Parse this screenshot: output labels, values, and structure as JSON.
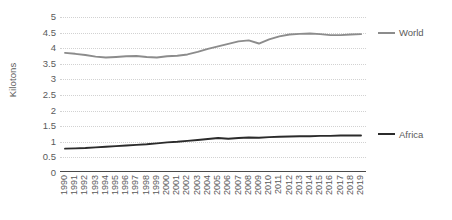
{
  "chart_data": {
    "type": "line",
    "title": "",
    "xlabel": "",
    "ylabel": "Kilotons",
    "ylim": [
      0,
      5
    ],
    "yticks": [
      "0",
      "0.5",
      "1",
      "1.5",
      "2",
      "2.5",
      "3",
      "3.5",
      "4",
      "4.5",
      "5"
    ],
    "ytick_values": [
      0,
      0.5,
      1,
      1.5,
      2,
      2.5,
      3,
      3.5,
      4,
      4.5,
      5
    ],
    "grid": true,
    "legend_position": "right",
    "x": [
      "1990",
      "1991",
      "1992",
      "1993",
      "1994",
      "1995",
      "1996",
      "1997",
      "1998",
      "1999",
      "2000",
      "2001",
      "2002",
      "2003",
      "2004",
      "2005",
      "2006",
      "2007",
      "2008",
      "2009",
      "2010",
      "2011",
      "2012",
      "2013",
      "2014",
      "2015",
      "2016",
      "2017",
      "2018",
      "2019"
    ],
    "categories": [
      "1990",
      "1991",
      "1992",
      "1993",
      "1994",
      "1995",
      "1996",
      "1997",
      "1998",
      "1999",
      "2000",
      "2001",
      "2002",
      "2003",
      "2004",
      "2005",
      "2006",
      "2007",
      "2008",
      "2009",
      "2010",
      "2011",
      "2012",
      "2013",
      "2014",
      "2015",
      "2016",
      "2017",
      "2018",
      "2019"
    ],
    "series": [
      {
        "name": "World",
        "color": "#8c8c8c",
        "values": [
          3.85,
          3.82,
          3.78,
          3.73,
          3.7,
          3.72,
          3.74,
          3.75,
          3.72,
          3.7,
          3.74,
          3.76,
          3.8,
          3.88,
          3.98,
          4.06,
          4.14,
          4.22,
          4.25,
          4.15,
          4.28,
          4.38,
          4.44,
          4.46,
          4.47,
          4.45,
          4.42,
          4.42,
          4.44,
          4.45
        ]
      },
      {
        "name": "Africa",
        "color": "#2b2b2b",
        "values": [
          0.78,
          0.79,
          0.8,
          0.82,
          0.84,
          0.86,
          0.88,
          0.9,
          0.92,
          0.95,
          0.98,
          1.0,
          1.03,
          1.06,
          1.09,
          1.12,
          1.1,
          1.12,
          1.14,
          1.13,
          1.15,
          1.16,
          1.17,
          1.18,
          1.18,
          1.19,
          1.19,
          1.2,
          1.2,
          1.2
        ]
      }
    ]
  },
  "legend": {
    "items": [
      {
        "label": "World",
        "color": "#8c8c8c"
      },
      {
        "label": "Africa",
        "color": "#2b2b2b"
      }
    ]
  }
}
